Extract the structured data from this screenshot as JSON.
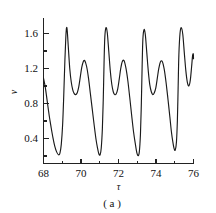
{
  "figure": {
    "caption": "( a )",
    "xlabel": "τ",
    "ylabel": "v"
  },
  "axes": {
    "x_ticks": [
      "68",
      "70",
      "72",
      "74",
      "76"
    ],
    "y_ticks": [
      "1.6",
      "1.2",
      "0.8",
      "0.4"
    ]
  },
  "chart_data": {
    "type": "line",
    "title": "",
    "subtitle": "",
    "caption": "( a )",
    "xlabel": "τ",
    "ylabel": "v",
    "xlim": [
      68,
      76
    ],
    "ylim": [
      0.22,
      1.72
    ],
    "x_major_ticks": [
      68,
      70,
      72,
      74,
      76
    ],
    "x_minor_ticks": [
      69,
      71,
      73,
      75
    ],
    "y_major_ticks": [
      0.4,
      0.8,
      1.2,
      1.6
    ],
    "y_minor_ticks": [
      0.6,
      1.0,
      1.4
    ],
    "grid": false,
    "legend": null,
    "legend_position": "none",
    "series": [
      {
        "name": "v",
        "color": "#1a1a1a",
        "x": [
          68.0,
          68.1,
          68.2,
          68.3,
          68.4,
          68.5,
          68.6,
          68.7,
          68.8,
          68.88,
          68.95,
          69.02,
          69.08,
          69.14,
          69.19,
          69.23,
          69.27,
          69.33,
          69.4,
          69.48,
          69.56,
          69.64,
          69.72,
          69.8,
          69.88,
          69.96,
          70.04,
          70.12,
          70.2,
          70.3,
          70.4,
          70.5,
          70.6,
          70.7,
          70.8,
          70.88,
          70.95,
          71.02,
          71.08,
          71.14,
          71.19,
          71.23,
          71.27,
          71.33,
          71.4,
          71.48,
          71.56,
          71.64,
          71.72,
          71.8,
          71.88,
          71.96,
          72.04,
          72.12,
          72.2,
          72.3,
          72.4,
          72.5,
          72.6,
          72.7,
          72.8,
          72.9,
          72.98,
          73.05,
          73.11,
          73.17,
          73.22,
          73.26,
          73.3,
          73.36,
          73.43,
          73.51,
          73.59,
          73.67,
          73.75,
          73.83,
          73.91,
          73.99,
          74.07,
          74.15,
          74.24,
          74.34,
          74.44,
          74.54,
          74.64,
          74.74,
          74.82,
          74.9,
          74.97,
          75.03,
          75.09,
          75.14,
          75.18,
          75.22,
          75.28,
          75.35,
          75.43,
          75.51,
          75.59,
          75.67,
          75.75,
          75.83,
          75.9,
          75.95,
          75.99,
          76.0
        ],
        "y": [
          1.1,
          1.0,
          0.86,
          0.72,
          0.6,
          0.49,
          0.4,
          0.34,
          0.31,
          0.33,
          0.42,
          0.62,
          0.92,
          1.28,
          1.52,
          1.62,
          1.58,
          1.4,
          1.2,
          1.06,
          0.98,
          0.94,
          0.93,
          0.95,
          1.01,
          1.11,
          1.21,
          1.27,
          1.28,
          1.22,
          1.1,
          0.94,
          0.78,
          0.62,
          0.47,
          0.38,
          0.32,
          0.31,
          0.38,
          0.58,
          0.9,
          1.26,
          1.52,
          1.62,
          1.57,
          1.38,
          1.18,
          1.04,
          0.96,
          0.93,
          0.94,
          0.99,
          1.09,
          1.2,
          1.27,
          1.28,
          1.2,
          1.07,
          0.9,
          0.72,
          0.55,
          0.42,
          0.33,
          0.3,
          0.34,
          0.52,
          0.85,
          1.22,
          1.5,
          1.6,
          1.55,
          1.36,
          1.17,
          1.03,
          0.96,
          0.93,
          0.95,
          1.0,
          1.1,
          1.2,
          1.27,
          1.27,
          1.19,
          1.05,
          0.88,
          0.7,
          0.55,
          0.44,
          0.37,
          0.36,
          0.44,
          0.66,
          1.0,
          1.34,
          1.56,
          1.62,
          1.55,
          1.36,
          1.18,
          1.06,
          1.02,
          1.08,
          1.22,
          1.33,
          1.35,
          1.3
        ]
      }
    ]
  }
}
